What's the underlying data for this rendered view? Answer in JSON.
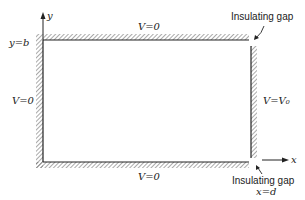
{
  "diagram": {
    "type": "boundary-value-problem",
    "axes": {
      "x_label": "x",
      "y_label": "y"
    },
    "labels": {
      "top_y": "y=b",
      "top_boundary": "V=0",
      "left_boundary": "V=0",
      "bottom_boundary": "V=0",
      "right_boundary": "V=V₀",
      "gap_top": "Insulating gap",
      "gap_bottom": "Insulating gap",
      "right_x": "x=d"
    }
  }
}
